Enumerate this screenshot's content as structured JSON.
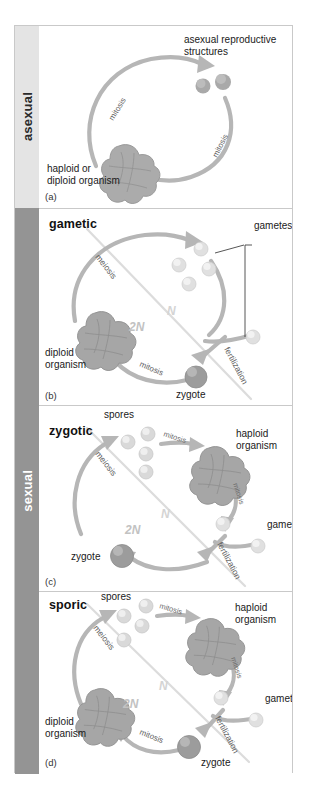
{
  "figure": {
    "rails": [
      {
        "label": "asexual",
        "group": "asexual"
      },
      {
        "label": "sexual",
        "group": "sexual"
      }
    ],
    "colors": {
      "rail_asexual": "#e4e4e4",
      "rail_sexual": "#949494",
      "arrow": "#b6b6b6",
      "diagonal": "#dcdcdc",
      "organism": "#a8a8a8",
      "zygote": "#9b9b9b",
      "gamete": "#e3e3e3",
      "spore": "#d8d8d8",
      "asexual_structure": "#a9a9a9",
      "n_label": "#d2d2d2",
      "twon_label": "#b4b4b4"
    },
    "panels": [
      {
        "caption": "(a)",
        "title": "",
        "group": "asexual",
        "labels": [
          {
            "name": "asexual-reproductive-structures",
            "text": "asexual reproductive\nstructures"
          },
          {
            "name": "haploid-or-diploid-organism",
            "text": "haploid or\ndiploid organism"
          }
        ],
        "steps": [
          "mitosis",
          "mitosis"
        ],
        "ploidy": []
      },
      {
        "caption": "(b)",
        "title": "gametic",
        "group": "sexual",
        "labels": [
          {
            "name": "gametes",
            "text": "gametes"
          },
          {
            "name": "diploid-organism",
            "text": "diploid\norganism"
          },
          {
            "name": "zygote",
            "text": "zygote"
          }
        ],
        "steps": [
          "meiosis",
          "fertilization",
          "mitosis"
        ],
        "ploidy": [
          "N",
          "2N"
        ]
      },
      {
        "caption": "(c)",
        "title": "zygotic",
        "group": "sexual",
        "labels": [
          {
            "name": "spores",
            "text": "spores"
          },
          {
            "name": "haploid-organism",
            "text": "haploid\norganism"
          },
          {
            "name": "gametes",
            "text": "gametes"
          },
          {
            "name": "zygote",
            "text": "zygote"
          }
        ],
        "steps": [
          "meiosis",
          "mitosis",
          "mitosis",
          "fertilization"
        ],
        "ploidy": [
          "N",
          "2N"
        ]
      },
      {
        "caption": "(d)",
        "title": "sporic",
        "group": "sexual",
        "labels": [
          {
            "name": "spores",
            "text": "spores"
          },
          {
            "name": "haploid-organism",
            "text": "haploid\norganism"
          },
          {
            "name": "gametes",
            "text": "gametes"
          },
          {
            "name": "diploid-organism",
            "text": "diploid\norganism"
          },
          {
            "name": "zygote",
            "text": "zygote"
          }
        ],
        "steps": [
          "meiosis",
          "mitosis",
          "mitosis",
          "fertilization",
          "mitosis"
        ],
        "ploidy": [
          "N",
          "2N"
        ]
      }
    ]
  }
}
